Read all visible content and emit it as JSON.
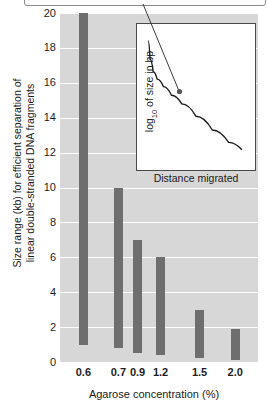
{
  "figure": {
    "callout": {
      "text": ""
    },
    "colors": {
      "bar": "#6e6e6e",
      "plot_background": "#d7d7d7",
      "gridline": "#ffffff",
      "inset_background": "#ffffff",
      "curve": "#1a1a1a"
    }
  },
  "chart_data": {
    "type": "bar",
    "title": "",
    "xlabel": "Agarose concentration (%)",
    "ylabel": "Size range (kb) for efficient separation of linear double-stranded DNA fragments",
    "ylabel_line1": "Size range (kb) for efficient separation of",
    "ylabel_line2": "linear double-stranded DNA fragments",
    "categories": [
      "0.6",
      "0.7",
      "0.9",
      "1.2",
      "1.5",
      "2.0"
    ],
    "ylim": [
      0,
      20
    ],
    "yticks": [
      20,
      18,
      16,
      14,
      12,
      10,
      8,
      6,
      4,
      2,
      0
    ],
    "grid": true,
    "legend": "none",
    "value_kind": "range",
    "ranges": [
      {
        "category": "0.6",
        "low": 1.0,
        "high": 20.0
      },
      {
        "category": "0.7",
        "low": 0.8,
        "high": 10.0
      },
      {
        "category": "0.9",
        "low": 0.5,
        "high": 7.0
      },
      {
        "category": "1.2",
        "low": 0.4,
        "high": 6.0
      },
      {
        "category": "1.5",
        "low": 0.2,
        "high": 3.0
      },
      {
        "category": "2.0",
        "low": 0.1,
        "high": 1.9
      }
    ]
  },
  "inset": {
    "type": "line",
    "title": "",
    "xlabel": "Distance migrated",
    "ylabel_main": "log",
    "ylabel_sub": "10",
    "ylabel_rest": " of size in bp",
    "ylabel": "log10 of size in bp",
    "grid": false,
    "xticks": [],
    "yticks": [],
    "series": [
      {
        "name": "migration-curve",
        "x": [
          0.03,
          0.05,
          0.08,
          0.12,
          0.18,
          0.26,
          0.36,
          0.5,
          0.66,
          0.82,
          0.95
        ],
        "y": [
          0.93,
          0.78,
          0.68,
          0.62,
          0.56,
          0.49,
          0.42,
          0.32,
          0.21,
          0.11,
          0.05
        ]
      }
    ],
    "annotation_point": {
      "x": 0.27,
      "y": 0.47
    }
  }
}
